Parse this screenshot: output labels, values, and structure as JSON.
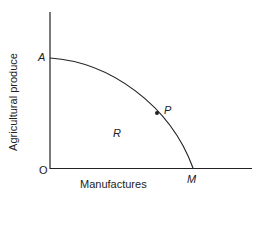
{
  "diagram": {
    "type": "production possibility frontier",
    "y_axis_label": "Agricultural produce",
    "x_axis_label": "Manufactures",
    "origin_label": "O",
    "points": {
      "A": "A",
      "P": "P",
      "M": "M"
    },
    "region_label": "R",
    "colors": {
      "line": "#222222",
      "background": "#ffffff"
    }
  }
}
